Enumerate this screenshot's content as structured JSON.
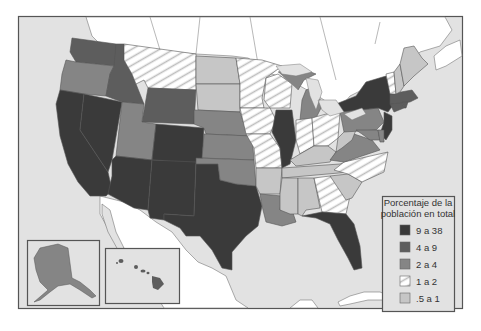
{
  "legend": {
    "title_line1": "Porcentaje de la",
    "title_line2": "población en total",
    "items": [
      {
        "key": "c1",
        "label": "9 a 38",
        "color": "#3a3a3a",
        "pattern": false
      },
      {
        "key": "c2",
        "label": "4 a 9",
        "color": "#5d5d5d",
        "pattern": false
      },
      {
        "key": "c3",
        "label": "2 a 4",
        "color": "#858585",
        "pattern": false
      },
      {
        "key": "c4",
        "label": "1 a 2",
        "color": "#ffffff",
        "pattern": true
      },
      {
        "key": "c5",
        "label": ".5 a 1",
        "color": "#c6c6c6",
        "pattern": false
      }
    ]
  },
  "colors": {
    "ocean": "#e2e2e2",
    "land_foreign": "#ffffff",
    "border": "#555555",
    "hatch": "#bdbdbd"
  },
  "states": [
    {
      "name": "Washington",
      "cat": "c2"
    },
    {
      "name": "Oregon",
      "cat": "c3"
    },
    {
      "name": "California",
      "cat": "c1"
    },
    {
      "name": "Nevada",
      "cat": "c1"
    },
    {
      "name": "Idaho",
      "cat": "c2"
    },
    {
      "name": "Montana",
      "cat": "c4"
    },
    {
      "name": "Wyoming",
      "cat": "c2"
    },
    {
      "name": "Utah",
      "cat": "c3"
    },
    {
      "name": "Arizona",
      "cat": "c1"
    },
    {
      "name": "Colorado",
      "cat": "c1"
    },
    {
      "name": "New Mexico",
      "cat": "c1"
    },
    {
      "name": "Texas",
      "cat": "c1"
    },
    {
      "name": "North Dakota",
      "cat": "c5"
    },
    {
      "name": "South Dakota",
      "cat": "c5"
    },
    {
      "name": "Nebraska",
      "cat": "c3"
    },
    {
      "name": "Kansas",
      "cat": "c3"
    },
    {
      "name": "Oklahoma",
      "cat": "c3"
    },
    {
      "name": "Minnesota",
      "cat": "c4"
    },
    {
      "name": "Iowa",
      "cat": "c4"
    },
    {
      "name": "Missouri",
      "cat": "c4"
    },
    {
      "name": "Arkansas",
      "cat": "c5"
    },
    {
      "name": "Louisiana",
      "cat": "c3"
    },
    {
      "name": "Wisconsin",
      "cat": "c4"
    },
    {
      "name": "Illinois",
      "cat": "c1"
    },
    {
      "name": "Michigan",
      "cat": "c3"
    },
    {
      "name": "Indiana",
      "cat": "c4"
    },
    {
      "name": "Ohio",
      "cat": "c4"
    },
    {
      "name": "Kentucky",
      "cat": "c5"
    },
    {
      "name": "Tennessee",
      "cat": "c5"
    },
    {
      "name": "Mississippi",
      "cat": "c5"
    },
    {
      "name": "Alabama",
      "cat": "c5"
    },
    {
      "name": "Georgia",
      "cat": "c4"
    },
    {
      "name": "Florida",
      "cat": "c1"
    },
    {
      "name": "South Carolina",
      "cat": "c5"
    },
    {
      "name": "North Carolina",
      "cat": "c4"
    },
    {
      "name": "Virginia",
      "cat": "c3"
    },
    {
      "name": "West Virginia",
      "cat": "c5"
    },
    {
      "name": "Pennsylvania",
      "cat": "c3"
    },
    {
      "name": "New York",
      "cat": "c1"
    },
    {
      "name": "New Jersey",
      "cat": "c1"
    },
    {
      "name": "Maryland",
      "cat": "c3"
    },
    {
      "name": "Delaware",
      "cat": "c3"
    },
    {
      "name": "Connecticut",
      "cat": "c2"
    },
    {
      "name": "Massachusetts",
      "cat": "c2"
    },
    {
      "name": "Rhode Island",
      "cat": "c2"
    },
    {
      "name": "Vermont",
      "cat": "c4"
    },
    {
      "name": "New Hampshire",
      "cat": "c5"
    },
    {
      "name": "Maine",
      "cat": "c5"
    },
    {
      "name": "Alaska",
      "cat": "c3"
    },
    {
      "name": "Hawaii",
      "cat": "c2"
    }
  ]
}
